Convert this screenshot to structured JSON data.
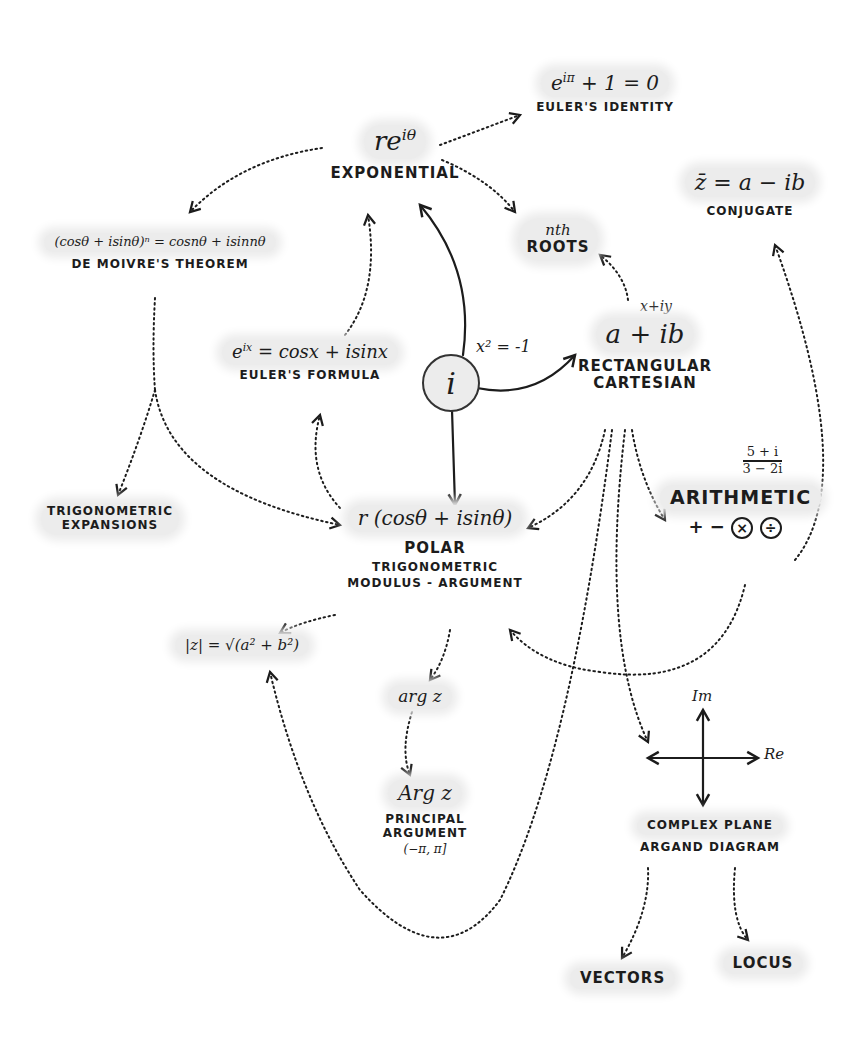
{
  "diagram": {
    "center": {
      "symbol": "i",
      "relation": "x² = -1"
    },
    "nodes": {
      "exponential": {
        "formula_base": "re",
        "formula_exp": "iθ",
        "label": "EXPONENTIAL"
      },
      "euler_identity": {
        "formula_base": "e",
        "formula_exp": "iπ",
        "formula_rest": " + 1 = 0",
        "label": "EULER'S IDENTITY"
      },
      "conjugate": {
        "formula": "z̄ = a − ib",
        "label": "CONJUGATE"
      },
      "de_moivre": {
        "formula": "(cosθ + isinθ)ⁿ = cosnθ + isinnθ",
        "label": "DE MOIVRE'S THEOREM"
      },
      "nth_roots": {
        "line1": "nth",
        "line2": "ROOTS"
      },
      "euler_formula": {
        "formula_base": "e",
        "formula_exp": "ix",
        "formula_rest": " = cosx + isinx",
        "label": "EULER'S FORMULA"
      },
      "rectangular": {
        "alt": "x+iy",
        "formula": "a + ib",
        "label1": "RECTANGULAR",
        "label2": "CARTESIAN"
      },
      "trig_expansions": {
        "label1": "TRIGONOMETRIC",
        "label2": "EXPANSIONS"
      },
      "polar": {
        "formula": "r (cosθ + isinθ)",
        "label1": "POLAR",
        "label2": "TRIGONOMETRIC",
        "label3": "MODULUS - ARGUMENT"
      },
      "arithmetic": {
        "example_num": "5 + i",
        "example_den": "3 − 2i",
        "label": "ARITHMETIC",
        "op_plus": "+",
        "op_minus": "−",
        "op_times": "×",
        "op_divide": "÷"
      },
      "modulus": {
        "formula": "|z| = √(a² + b²)"
      },
      "arg": {
        "formula": "arg z"
      },
      "principal_arg": {
        "formula": "Arg z",
        "label1": "PRINCIPAL",
        "label2": "ARGUMENT",
        "range": "(−π, π]"
      },
      "complex_plane": {
        "axis_im": "Im",
        "axis_re": "Re",
        "label1": "COMPLEX PLANE",
        "label2": "ARGAND DIAGRAM"
      },
      "vectors": {
        "label": "VECTORS"
      },
      "locus": {
        "label": "LOCUS"
      }
    },
    "colors": {
      "ink": "#1c1c1c",
      "highlight": "#ececec",
      "background": "#ffffff"
    }
  }
}
